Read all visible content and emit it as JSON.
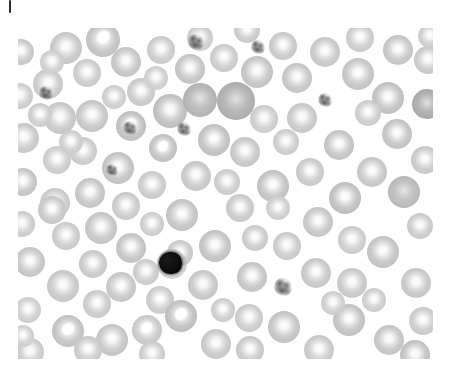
{
  "image": {
    "kind": "micrograph",
    "modality": "light-microscopy",
    "specimen": "peripheral-blood-smear",
    "stain_appearance": "grayscale",
    "background_color": "#ffffff",
    "canvas": {
      "width": 450,
      "height": 381
    },
    "field": {
      "x": 18,
      "y": 28,
      "width": 415,
      "height": 331
    },
    "alt_text": "Grayscale light micrograph of a peripheral blood smear showing numerous red blood cells with pale central pallor, one dark-nucleated white blood cell (lymphocyte) and several small speckled platelets."
  },
  "artifacts": {
    "corner_tick": {
      "x": 9,
      "y": 0,
      "width": 2,
      "height": 13,
      "color": "#2c2c2c"
    }
  },
  "palette": {
    "background": "#ffffff",
    "rbc_rim_light": "#dcdcdc",
    "rbc_rim_mid": "#cccccc",
    "rbc_rim_dark": "#b4b4b4",
    "rbc_dense": "#a8a8a8",
    "nucleus_dark": "#0d0d0d",
    "platelet_granule": "#4a4a4a",
    "tick_mark": "#2c2c2c"
  },
  "counts": {
    "red_blood_cells": 112,
    "white_blood_cells": 1,
    "platelets": 6
  },
  "cells": [
    {
      "type": "rbc",
      "cx": 21,
      "cy": 52,
      "r": 13,
      "rim": "#d0d0d0",
      "variant": "plain"
    },
    {
      "type": "rbc",
      "cx": 66,
      "cy": 48,
      "r": 16,
      "rim": "#cfcfcf",
      "variant": "plain"
    },
    {
      "type": "rbc",
      "cx": 103,
      "cy": 40,
      "r": 17,
      "rim": "#c9c9c9",
      "variant": "stripe"
    },
    {
      "type": "rbc",
      "cx": 87,
      "cy": 73,
      "r": 14,
      "rim": "#d4d4d4",
      "variant": "plain"
    },
    {
      "type": "rbc",
      "cx": 48,
      "cy": 84,
      "r": 15,
      "rim": "#d2d2d2",
      "variant": "plain"
    },
    {
      "type": "rbc",
      "cx": 20,
      "cy": 96,
      "r": 13,
      "rim": "#d6d6d6",
      "variant": "plain"
    },
    {
      "type": "rbc",
      "cx": 60,
      "cy": 118,
      "r": 16,
      "rim": "#cfcfcf",
      "variant": "plain"
    },
    {
      "type": "rbc",
      "cx": 24,
      "cy": 138,
      "r": 15,
      "rim": "#d1d1d1",
      "variant": "plain"
    },
    {
      "type": "rbc",
      "cx": 57,
      "cy": 160,
      "r": 14,
      "rim": "#d5d5d5",
      "variant": "plain"
    },
    {
      "type": "rbc",
      "cx": 23,
      "cy": 182,
      "r": 14,
      "rim": "#cdcdcd",
      "variant": "plain"
    },
    {
      "type": "rbc",
      "cx": 55,
      "cy": 203,
      "r": 15,
      "rim": "#d3d3d3",
      "variant": "plain"
    },
    {
      "type": "rbc",
      "cx": 22,
      "cy": 224,
      "r": 13,
      "rim": "#d6d6d6",
      "variant": "plain"
    },
    {
      "type": "rbc",
      "cx": 30,
      "cy": 262,
      "r": 15,
      "rim": "#cecece",
      "variant": "plain"
    },
    {
      "type": "rbc",
      "cx": 63,
      "cy": 286,
      "r": 16,
      "rim": "#d0d0d0",
      "variant": "plain"
    },
    {
      "type": "rbc",
      "cx": 28,
      "cy": 310,
      "r": 13,
      "rim": "#d8d8d8",
      "variant": "plain"
    },
    {
      "type": "rbc",
      "cx": 68,
      "cy": 331,
      "r": 16,
      "rim": "#cacaca",
      "variant": "stripe"
    },
    {
      "type": "rbc",
      "cx": 30,
      "cy": 352,
      "r": 14,
      "rim": "#d4d4d4",
      "variant": "plain"
    },
    {
      "type": "rbc",
      "cx": 97,
      "cy": 304,
      "r": 14,
      "rim": "#d3d3d3",
      "variant": "plain"
    },
    {
      "type": "rbc",
      "cx": 112,
      "cy": 340,
      "r": 16,
      "rim": "#cdcdcd",
      "variant": "plain"
    },
    {
      "type": "rbc",
      "cx": 147,
      "cy": 330,
      "r": 15,
      "rim": "#d1d1d1",
      "variant": "stripe"
    },
    {
      "type": "rbc",
      "cx": 160,
      "cy": 300,
      "r": 14,
      "rim": "#d5d5d5",
      "variant": "plain"
    },
    {
      "type": "rbc",
      "cx": 121,
      "cy": 287,
      "r": 15,
      "rim": "#cfcfcf",
      "variant": "plain"
    },
    {
      "type": "rbc",
      "cx": 93,
      "cy": 264,
      "r": 14,
      "rim": "#d2d2d2",
      "variant": "plain"
    },
    {
      "type": "rbc",
      "cx": 131,
      "cy": 248,
      "r": 15,
      "rim": "#cbcbcb",
      "variant": "plain"
    },
    {
      "type": "rbc",
      "cx": 101,
      "cy": 228,
      "r": 16,
      "rim": "#cdcdcd",
      "variant": "plain"
    },
    {
      "type": "rbc",
      "cx": 66,
      "cy": 236,
      "r": 14,
      "rim": "#d4d4d4",
      "variant": "plain"
    },
    {
      "type": "rbc",
      "cx": 52,
      "cy": 210,
      "r": 14,
      "rim": "#d0d0d0",
      "variant": "plain"
    },
    {
      "type": "rbc",
      "cx": 90,
      "cy": 193,
      "r": 15,
      "rim": "#cccccc",
      "variant": "plain"
    },
    {
      "type": "rbc",
      "cx": 126,
      "cy": 206,
      "r": 14,
      "rim": "#d3d3d3",
      "variant": "plain"
    },
    {
      "type": "rbc",
      "cx": 118,
      "cy": 168,
      "r": 16,
      "rim": "#cacaca",
      "variant": "plain"
    },
    {
      "type": "rbc",
      "cx": 83,
      "cy": 151,
      "r": 14,
      "rim": "#d5d5d5",
      "variant": "plain"
    },
    {
      "type": "rbc",
      "cx": 92,
      "cy": 116,
      "r": 16,
      "rim": "#cecece",
      "variant": "plain"
    },
    {
      "type": "rbc",
      "cx": 131,
      "cy": 126,
      "r": 15,
      "rim": "#c7c7c7",
      "variant": "stripe"
    },
    {
      "type": "rbc",
      "cx": 141,
      "cy": 92,
      "r": 14,
      "rim": "#d2d2d2",
      "variant": "plain"
    },
    {
      "type": "rbc",
      "cx": 126,
      "cy": 62,
      "r": 15,
      "rim": "#cdcdcd",
      "variant": "plain"
    },
    {
      "type": "rbc",
      "cx": 161,
      "cy": 50,
      "r": 14,
      "rim": "#d4d4d4",
      "variant": "plain"
    },
    {
      "type": "rbc",
      "cx": 170,
      "cy": 111,
      "r": 17,
      "rim": "#c5c5c5",
      "variant": "plain"
    },
    {
      "type": "rbc",
      "cx": 163,
      "cy": 148,
      "r": 14,
      "rim": "#c9c9c9",
      "variant": "stripe"
    },
    {
      "type": "rbc",
      "cx": 152,
      "cy": 185,
      "r": 14,
      "rim": "#d4d4d4",
      "variant": "plain"
    },
    {
      "type": "rbc",
      "cx": 182,
      "cy": 215,
      "r": 16,
      "rim": "#cbcbcb",
      "variant": "plain"
    },
    {
      "type": "rbc",
      "cx": 196,
      "cy": 176,
      "r": 15,
      "rim": "#cfcfcf",
      "variant": "plain"
    },
    {
      "type": "rbc",
      "cx": 214,
      "cy": 140,
      "r": 16,
      "rim": "#c8c8c8",
      "variant": "plain"
    },
    {
      "type": "rbc",
      "cx": 200,
      "cy": 100,
      "r": 17,
      "rim": "#bdbdbd",
      "variant": "dark"
    },
    {
      "type": "rbc",
      "cx": 236,
      "cy": 101,
      "r": 19,
      "rim": "#b6b6b6",
      "variant": "dark"
    },
    {
      "type": "rbc",
      "cx": 190,
      "cy": 69,
      "r": 15,
      "rim": "#cccccc",
      "variant": "plain"
    },
    {
      "type": "rbc",
      "cx": 224,
      "cy": 58,
      "r": 14,
      "rim": "#d3d3d3",
      "variant": "plain"
    },
    {
      "type": "rbc",
      "cx": 257,
      "cy": 72,
      "r": 16,
      "rim": "#cbcbcb",
      "variant": "plain"
    },
    {
      "type": "rbc",
      "cx": 283,
      "cy": 46,
      "r": 14,
      "rim": "#d1d1d1",
      "variant": "plain"
    },
    {
      "type": "rbc",
      "cx": 297,
      "cy": 78,
      "r": 15,
      "rim": "#cdcdcd",
      "variant": "plain"
    },
    {
      "type": "rbc",
      "cx": 264,
      "cy": 119,
      "r": 14,
      "rim": "#d5d5d5",
      "variant": "plain"
    },
    {
      "type": "rbc",
      "cx": 245,
      "cy": 152,
      "r": 15,
      "rim": "#cfcfcf",
      "variant": "plain"
    },
    {
      "type": "rbc",
      "cx": 273,
      "cy": 186,
      "r": 16,
      "rim": "#c9c9c9",
      "variant": "plain"
    },
    {
      "type": "rbc",
      "cx": 240,
      "cy": 208,
      "r": 14,
      "rim": "#d2d2d2",
      "variant": "plain"
    },
    {
      "type": "rbc",
      "cx": 215,
      "cy": 246,
      "r": 16,
      "rim": "#cacaca",
      "variant": "plain"
    },
    {
      "type": "rbc",
      "cx": 203,
      "cy": 285,
      "r": 15,
      "rim": "#cecece",
      "variant": "plain"
    },
    {
      "type": "rbc",
      "cx": 181,
      "cy": 316,
      "r": 16,
      "rim": "#c6c6c6",
      "variant": "stripe"
    },
    {
      "type": "rbc",
      "cx": 216,
      "cy": 344,
      "r": 15,
      "rim": "#d0d0d0",
      "variant": "plain"
    },
    {
      "type": "rbc",
      "cx": 249,
      "cy": 318,
      "r": 14,
      "rim": "#d4d4d4",
      "variant": "plain"
    },
    {
      "type": "rbc",
      "cx": 252,
      "cy": 277,
      "r": 15,
      "rim": "#cccccc",
      "variant": "plain"
    },
    {
      "type": "rbc",
      "cx": 287,
      "cy": 246,
      "r": 14,
      "rim": "#d3d3d3",
      "variant": "plain"
    },
    {
      "type": "rbc",
      "cx": 316,
      "cy": 273,
      "r": 15,
      "rim": "#cfcfcf",
      "variant": "plain"
    },
    {
      "type": "rbc",
      "cx": 284,
      "cy": 327,
      "r": 16,
      "rim": "#cbcbcb",
      "variant": "plain"
    },
    {
      "type": "rbc",
      "cx": 319,
      "cy": 350,
      "r": 15,
      "rim": "#d1d1d1",
      "variant": "plain"
    },
    {
      "type": "rbc",
      "cx": 349,
      "cy": 320,
      "r": 16,
      "rim": "#c9c9c9",
      "variant": "plain"
    },
    {
      "type": "rbc",
      "cx": 352,
      "cy": 283,
      "r": 15,
      "rim": "#d0d0d0",
      "variant": "plain"
    },
    {
      "type": "rbc",
      "cx": 383,
      "cy": 252,
      "r": 16,
      "rim": "#cacaca",
      "variant": "plain"
    },
    {
      "type": "rbc",
      "cx": 416,
      "cy": 283,
      "r": 15,
      "rim": "#cfcfcf",
      "variant": "plain"
    },
    {
      "type": "rbc",
      "cx": 423,
      "cy": 321,
      "r": 14,
      "rim": "#d3d3d3",
      "variant": "plain"
    },
    {
      "type": "rbc",
      "cx": 389,
      "cy": 340,
      "r": 15,
      "rim": "#cdcdcd",
      "variant": "plain"
    },
    {
      "type": "rbc",
      "cx": 415,
      "cy": 355,
      "r": 15,
      "rim": "#c8c8c8",
      "variant": "plain"
    },
    {
      "type": "rbc",
      "cx": 352,
      "cy": 240,
      "r": 14,
      "rim": "#d5d5d5",
      "variant": "plain"
    },
    {
      "type": "rbc",
      "cx": 318,
      "cy": 222,
      "r": 15,
      "rim": "#cecece",
      "variant": "plain"
    },
    {
      "type": "rbc",
      "cx": 345,
      "cy": 198,
      "r": 16,
      "rim": "#c6c6c6",
      "variant": "plain"
    },
    {
      "type": "rbc",
      "cx": 310,
      "cy": 172,
      "r": 14,
      "rim": "#d2d2d2",
      "variant": "plain"
    },
    {
      "type": "rbc",
      "cx": 339,
      "cy": 145,
      "r": 15,
      "rim": "#cbcbcb",
      "variant": "plain"
    },
    {
      "type": "rbc",
      "cx": 372,
      "cy": 172,
      "r": 15,
      "rim": "#cfcfcf",
      "variant": "plain"
    },
    {
      "type": "rbc",
      "cx": 404,
      "cy": 192,
      "r": 16,
      "rim": "#c4c4c4",
      "variant": "dark"
    },
    {
      "type": "rbc",
      "cx": 425,
      "cy": 160,
      "r": 14,
      "rim": "#d1d1d1",
      "variant": "plain"
    },
    {
      "type": "rbc",
      "cx": 397,
      "cy": 134,
      "r": 15,
      "rim": "#cacaca",
      "variant": "plain"
    },
    {
      "type": "rbc",
      "cx": 427,
      "cy": 104,
      "r": 15,
      "rim": "#b2b2b2",
      "variant": "dark"
    },
    {
      "type": "rbc",
      "cx": 388,
      "cy": 98,
      "r": 16,
      "rim": "#c8c8c8",
      "variant": "plain"
    },
    {
      "type": "rbc",
      "cx": 358,
      "cy": 74,
      "r": 16,
      "rim": "#cccccc",
      "variant": "plain"
    },
    {
      "type": "rbc",
      "cx": 325,
      "cy": 52,
      "r": 15,
      "rim": "#d0d0d0",
      "variant": "plain"
    },
    {
      "type": "rbc",
      "cx": 360,
      "cy": 38,
      "r": 14,
      "rim": "#d4d4d4",
      "variant": "plain"
    },
    {
      "type": "rbc",
      "cx": 398,
      "cy": 50,
      "r": 15,
      "rim": "#cdcdcd",
      "variant": "plain"
    },
    {
      "type": "rbc",
      "cx": 428,
      "cy": 60,
      "r": 14,
      "rim": "#d2d2d2",
      "variant": "plain"
    },
    {
      "type": "rbc",
      "cx": 302,
      "cy": 118,
      "r": 15,
      "rim": "#d0d0d0",
      "variant": "plain"
    },
    {
      "type": "rbc",
      "cx": 368,
      "cy": 113,
      "r": 13,
      "rim": "#d6d6d6",
      "variant": "plain"
    },
    {
      "type": "rbc",
      "cx": 286,
      "cy": 142,
      "r": 13,
      "rim": "#d6d6d6",
      "variant": "plain"
    },
    {
      "type": "rbc",
      "cx": 227,
      "cy": 182,
      "r": 13,
      "rim": "#d5d5d5",
      "variant": "plain"
    },
    {
      "type": "rbc",
      "cx": 255,
      "cy": 238,
      "r": 13,
      "rim": "#d4d4d4",
      "variant": "plain"
    },
    {
      "type": "rbc",
      "cx": 180,
      "cy": 253,
      "r": 13,
      "rim": "#d3d3d3",
      "variant": "plain"
    },
    {
      "type": "rbc",
      "cx": 146,
      "cy": 272,
      "r": 13,
      "rim": "#d5d5d5",
      "variant": "plain"
    },
    {
      "type": "rbc",
      "cx": 152,
      "cy": 224,
      "r": 12,
      "rim": "#d7d7d7",
      "variant": "plain"
    },
    {
      "type": "rbc",
      "cx": 200,
      "cy": 38,
      "r": 13,
      "rim": "#d6d6d6",
      "variant": "plain"
    },
    {
      "type": "rbc",
      "cx": 247,
      "cy": 30,
      "r": 13,
      "rim": "#d4d4d4",
      "variant": "plain"
    },
    {
      "type": "rbc",
      "cx": 156,
      "cy": 78,
      "r": 12,
      "rim": "#d8d8d8",
      "variant": "plain"
    },
    {
      "type": "rbc",
      "cx": 71,
      "cy": 142,
      "r": 12,
      "rim": "#d7d7d7",
      "variant": "plain"
    },
    {
      "type": "rbc",
      "cx": 40,
      "cy": 115,
      "r": 12,
      "rim": "#d6d6d6",
      "variant": "plain"
    },
    {
      "type": "rbc",
      "cx": 88,
      "cy": 350,
      "r": 14,
      "rim": "#d2d2d2",
      "variant": "plain"
    },
    {
      "type": "rbc",
      "cx": 52,
      "cy": 62,
      "r": 12,
      "rim": "#d8d8d8",
      "variant": "plain"
    },
    {
      "type": "rbc",
      "cx": 114,
      "cy": 97,
      "r": 12,
      "rim": "#d7d7d7",
      "variant": "plain"
    },
    {
      "type": "rbc",
      "cx": 250,
      "cy": 350,
      "r": 14,
      "rim": "#d2d2d2",
      "variant": "plain"
    },
    {
      "type": "rbc",
      "cx": 152,
      "cy": 354,
      "r": 13,
      "rim": "#d5d5d5",
      "variant": "plain"
    },
    {
      "type": "rbc",
      "cx": 333,
      "cy": 303,
      "r": 12,
      "rim": "#d8d8d8",
      "variant": "plain"
    },
    {
      "type": "rbc",
      "cx": 374,
      "cy": 300,
      "r": 12,
      "rim": "#d7d7d7",
      "variant": "plain"
    },
    {
      "type": "rbc",
      "cx": 223,
      "cy": 310,
      "r": 12,
      "rim": "#d6d6d6",
      "variant": "plain"
    },
    {
      "type": "rbc",
      "cx": 278,
      "cy": 208,
      "r": 12,
      "rim": "#d8d8d8",
      "variant": "plain"
    },
    {
      "type": "rbc",
      "cx": 420,
      "cy": 226,
      "r": 13,
      "rim": "#d4d4d4",
      "variant": "plain"
    },
    {
      "type": "rbc",
      "cx": 430,
      "cy": 36,
      "r": 12,
      "rim": "#d8d8d8",
      "variant": "plain"
    },
    {
      "type": "rbc",
      "cx": 23,
      "cy": 336,
      "r": 11,
      "rim": "#d9d9d9",
      "variant": "plain"
    },
    {
      "type": "wbc",
      "subtype": "lymphocyte",
      "cx": 172,
      "cy": 264,
      "r": 15,
      "label": "white-blood-cell"
    },
    {
      "type": "platelet",
      "cx": 196,
      "cy": 42,
      "r": 8
    },
    {
      "type": "platelet",
      "cx": 258,
      "cy": 47,
      "r": 7
    },
    {
      "type": "platelet",
      "cx": 325,
      "cy": 100,
      "r": 7
    },
    {
      "type": "platelet",
      "cx": 46,
      "cy": 93,
      "r": 7
    },
    {
      "type": "platelet",
      "cx": 130,
      "cy": 128,
      "r": 7
    },
    {
      "type": "platelet",
      "cx": 112,
      "cy": 170,
      "r": 6
    },
    {
      "type": "platelet",
      "cx": 184,
      "cy": 129,
      "r": 7
    },
    {
      "type": "platelet",
      "cx": 283,
      "cy": 287,
      "r": 9
    }
  ]
}
